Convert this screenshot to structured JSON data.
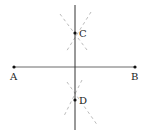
{
  "diagram": {
    "type": "perpendicular-bisector-construction",
    "points": [
      {
        "id": "A",
        "label": "A",
        "x": 14,
        "y": 67
      },
      {
        "id": "B",
        "label": "B",
        "x": 135,
        "y": 67
      },
      {
        "id": "C",
        "label": "C",
        "x": 75,
        "y": 33
      },
      {
        "id": "D",
        "label": "D",
        "x": 75,
        "y": 100
      }
    ],
    "segments": [
      {
        "from": "A",
        "to": "B",
        "style": "solid"
      },
      {
        "name": "perpendicular-bisector",
        "x": 75,
        "y1": 5,
        "y2": 130,
        "style": "solid"
      }
    ],
    "arcs": "dashed construction arcs intersecting at C and D",
    "colors": {
      "line": "#333333",
      "arc": "#999999",
      "point": "#111111"
    }
  }
}
